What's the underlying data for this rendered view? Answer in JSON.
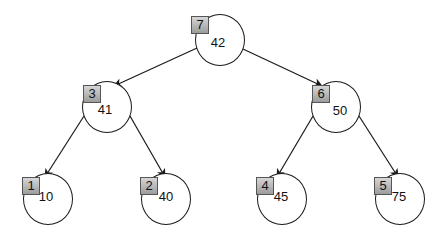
{
  "diagram": {
    "type": "binary-tree",
    "nodes": [
      {
        "index": "7",
        "value": "42",
        "level": 0,
        "cx": 220,
        "cy": 40
      },
      {
        "index": "3",
        "value": "41",
        "level": 1,
        "cx": 107,
        "cy": 107
      },
      {
        "index": "6",
        "value": "50",
        "level": 1,
        "cx": 336,
        "cy": 107
      },
      {
        "index": "1",
        "value": "10",
        "level": 2,
        "cx": 48,
        "cy": 199
      },
      {
        "index": "2",
        "value": "40",
        "level": 2,
        "cx": 166,
        "cy": 199
      },
      {
        "index": "4",
        "value": "45",
        "level": 2,
        "cx": 282,
        "cy": 199
      },
      {
        "index": "5",
        "value": "75",
        "level": 2,
        "cx": 400,
        "cy": 199
      }
    ],
    "edges": [
      {
        "from": "7",
        "to": "3"
      },
      {
        "from": "7",
        "to": "6"
      },
      {
        "from": "3",
        "to": "1"
      },
      {
        "from": "3",
        "to": "2"
      },
      {
        "from": "6",
        "to": "4"
      },
      {
        "from": "6",
        "to": "5"
      }
    ],
    "colors": {
      "stroke": "#1a1a1a",
      "index_box_top": "#d6d6d6",
      "index_box_bottom": "#9c9c9c",
      "background": "#ffffff"
    }
  }
}
